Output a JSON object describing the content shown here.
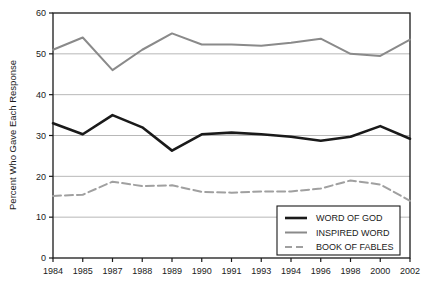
{
  "chart_data": {
    "type": "line",
    "title": "",
    "xlabel": "",
    "ylabel": "Percent Who Gave Each Response",
    "ylim": [
      0,
      60
    ],
    "yticks": [
      0,
      10,
      20,
      30,
      40,
      50,
      60
    ],
    "grid": true,
    "legend_position": "lower-right-inside",
    "categories": [
      "1984",
      "1985",
      "1987",
      "1988",
      "1989",
      "1990",
      "1991",
      "1993",
      "1994",
      "1996",
      "1998",
      "2000",
      "2002"
    ],
    "series": [
      {
        "name": "WORD OF GOD",
        "color": "#1a1a1a",
        "style": "solid",
        "width": 2.6,
        "values": [
          33.0,
          30.3,
          35.0,
          32.0,
          26.3,
          30.3,
          30.7,
          30.3,
          29.7,
          28.7,
          29.7,
          32.3,
          29.2
        ]
      },
      {
        "name": "INSPIRED WORD",
        "color": "#8a8a8a",
        "style": "solid",
        "width": 2.0,
        "values": [
          51.0,
          54.0,
          46.0,
          51.0,
          55.0,
          52.3,
          52.3,
          52.0,
          52.7,
          53.7,
          50.0,
          49.5,
          53.5
        ]
      },
      {
        "name": "BOOK OF FABLES",
        "color": "#a0a0a0",
        "style": "dashed",
        "width": 2.0,
        "values": [
          15.2,
          15.5,
          18.7,
          17.6,
          17.8,
          16.2,
          16.0,
          16.3,
          16.3,
          17.0,
          19.0,
          18.0,
          14.0
        ]
      }
    ],
    "legend_entries": [
      "WORD OF GOD",
      "INSPIRED WORD",
      "BOOK OF FABLES"
    ]
  },
  "colors": {
    "axis": "#1a1a1a",
    "grid": "#9a9a9a",
    "background": "#ffffff",
    "series_black": "#1a1a1a",
    "series_gray": "#8a8a8a",
    "series_gray_dashed": "#a0a0a0"
  }
}
